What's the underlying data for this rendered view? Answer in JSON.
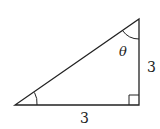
{
  "diagram": {
    "type": "right-triangle",
    "vertices": {
      "left": [
        15,
        105
      ],
      "right_angle": [
        139,
        105
      ],
      "top": [
        139,
        19
      ]
    },
    "labels": {
      "angle_top": "θ",
      "side_vertical": "3",
      "side_horizontal": "3"
    },
    "colors": {
      "stroke": "#222222",
      "background": "#ffffff"
    }
  }
}
